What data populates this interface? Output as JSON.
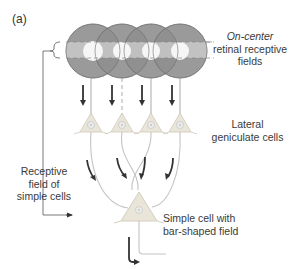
{
  "panel_label": "(a)",
  "labels": {
    "retinal_fields": {
      "line1": "On-center",
      "line2": "retinal receptive",
      "line3": "fields"
    },
    "lgn_cells": {
      "line1": "Lateral",
      "line2": "geniculate cells"
    },
    "receptive_field": {
      "line1": "Receptive",
      "line2": "field of",
      "line3": "simple cells"
    },
    "simple_cell": {
      "line1": "Simple cell with",
      "line2": "bar-shaped field"
    }
  },
  "colors": {
    "surround": "#8f8f8f",
    "band": "#c9c9c9",
    "center": "#f4f4f4",
    "neuron_fill": "#e9e5d9",
    "neuron_stroke": "#cfc9b8",
    "axon": "#c2c2c2",
    "arrow": "#333333"
  }
}
